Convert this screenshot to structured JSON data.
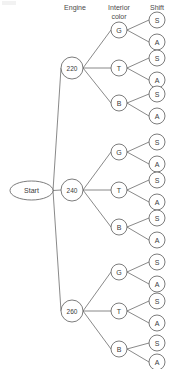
{
  "diagram": {
    "headers": [
      {
        "label": "Engine",
        "x": 75,
        "y": 7
      },
      {
        "label": "Interior",
        "x": 119,
        "y": 7
      },
      {
        "label": "color",
        "x": 119,
        "y": 16
      },
      {
        "label": "Shift",
        "x": 157,
        "y": 7
      }
    ],
    "root": {
      "label": "Start",
      "cx": 31.5,
      "cy": 190.5,
      "rx": 21.5,
      "ry": 9.5
    },
    "level1_label": "Engine",
    "level2_label": "Interior color",
    "level3_label": "Shift",
    "engines": [
      {
        "label": "220",
        "cx": 72,
        "cy": 68,
        "r": 11
      },
      {
        "label": "240",
        "cx": 72,
        "cy": 190,
        "r": 11
      },
      {
        "label": "260",
        "cx": 72,
        "cy": 311,
        "r": 11
      }
    ],
    "colors": [
      {
        "label": "G",
        "cx": 119,
        "cy": 30,
        "r": 8
      },
      {
        "label": "T",
        "cx": 119,
        "cy": 68,
        "r": 8
      },
      {
        "label": "B",
        "cx": 119,
        "cy": 103,
        "r": 8
      },
      {
        "label": "G",
        "cx": 119,
        "cy": 152,
        "r": 8
      },
      {
        "label": "T",
        "cx": 119,
        "cy": 190,
        "r": 8
      },
      {
        "label": "B",
        "cx": 119,
        "cy": 227,
        "r": 8
      },
      {
        "label": "G",
        "cx": 119,
        "cy": 272,
        "r": 8
      },
      {
        "label": "T",
        "cx": 119,
        "cy": 311,
        "r": 8
      },
      {
        "label": "B",
        "cx": 119,
        "cy": 349,
        "r": 8
      }
    ],
    "shifts": [
      {
        "label": "S",
        "cx": 157,
        "cy": 20,
        "r": 8
      },
      {
        "label": "A",
        "cx": 157,
        "cy": 42,
        "r": 8
      },
      {
        "label": "S",
        "cx": 157,
        "cy": 58,
        "r": 8
      },
      {
        "label": "A",
        "cx": 157,
        "cy": 80,
        "r": 8
      },
      {
        "label": "S",
        "cx": 157,
        "cy": 94,
        "r": 8
      },
      {
        "label": "A",
        "cx": 157,
        "cy": 116,
        "r": 8
      },
      {
        "label": "S",
        "cx": 157,
        "cy": 142,
        "r": 8
      },
      {
        "label": "A",
        "cx": 157,
        "cy": 164,
        "r": 8
      },
      {
        "label": "S",
        "cx": 157,
        "cy": 180,
        "r": 8
      },
      {
        "label": "A",
        "cx": 157,
        "cy": 202,
        "r": 8
      },
      {
        "label": "S",
        "cx": 157,
        "cy": 218,
        "r": 8
      },
      {
        "label": "A",
        "cx": 157,
        "cy": 240,
        "r": 8
      },
      {
        "label": "S",
        "cx": 157,
        "cy": 262,
        "r": 8
      },
      {
        "label": "A",
        "cx": 157,
        "cy": 284,
        "r": 8
      },
      {
        "label": "S",
        "cx": 157,
        "cy": 301,
        "r": 8
      },
      {
        "label": "A",
        "cx": 157,
        "cy": 323,
        "r": 8
      },
      {
        "label": "S",
        "cx": 157,
        "cy": 343,
        "r": 8
      },
      {
        "label": "A",
        "cx": 157,
        "cy": 362,
        "r": 8
      }
    ],
    "edges_root_to_engine": [
      {
        "x1": 53,
        "y1": 190.5,
        "x2": 61,
        "y2": 68
      },
      {
        "x1": 53,
        "y1": 190.5,
        "x2": 61,
        "y2": 190
      },
      {
        "x1": 53,
        "y1": 190.5,
        "x2": 61,
        "y2": 311
      }
    ],
    "edges_engine_to_color": [
      {
        "x1": 83,
        "y1": 68,
        "x2": 111,
        "y2": 30
      },
      {
        "x1": 83,
        "y1": 68,
        "x2": 111,
        "y2": 68
      },
      {
        "x1": 83,
        "y1": 68,
        "x2": 111,
        "y2": 103
      },
      {
        "x1": 83,
        "y1": 190,
        "x2": 111,
        "y2": 152
      },
      {
        "x1": 83,
        "y1": 190,
        "x2": 111,
        "y2": 190
      },
      {
        "x1": 83,
        "y1": 190,
        "x2": 111,
        "y2": 227
      },
      {
        "x1": 83,
        "y1": 311,
        "x2": 111,
        "y2": 272
      },
      {
        "x1": 83,
        "y1": 311,
        "x2": 111,
        "y2": 311
      },
      {
        "x1": 83,
        "y1": 311,
        "x2": 111,
        "y2": 349
      }
    ],
    "edges_color_to_shift": [
      {
        "x1": 127,
        "y1": 30,
        "x2": 149,
        "y2": 20
      },
      {
        "x1": 127,
        "y1": 30,
        "x2": 149,
        "y2": 42
      },
      {
        "x1": 127,
        "y1": 68,
        "x2": 149,
        "y2": 58
      },
      {
        "x1": 127,
        "y1": 68,
        "x2": 149,
        "y2": 80
      },
      {
        "x1": 127,
        "y1": 103,
        "x2": 149,
        "y2": 94
      },
      {
        "x1": 127,
        "y1": 103,
        "x2": 149,
        "y2": 116
      },
      {
        "x1": 127,
        "y1": 152,
        "x2": 149,
        "y2": 142
      },
      {
        "x1": 127,
        "y1": 152,
        "x2": 149,
        "y2": 164
      },
      {
        "x1": 127,
        "y1": 190,
        "x2": 149,
        "y2": 180
      },
      {
        "x1": 127,
        "y1": 190,
        "x2": 149,
        "y2": 202
      },
      {
        "x1": 127,
        "y1": 227,
        "x2": 149,
        "y2": 218
      },
      {
        "x1": 127,
        "y1": 227,
        "x2": 149,
        "y2": 240
      },
      {
        "x1": 127,
        "y1": 272,
        "x2": 149,
        "y2": 262
      },
      {
        "x1": 127,
        "y1": 272,
        "x2": 149,
        "y2": 284
      },
      {
        "x1": 127,
        "y1": 311,
        "x2": 149,
        "y2": 301
      },
      {
        "x1": 127,
        "y1": 311,
        "x2": 149,
        "y2": 323
      },
      {
        "x1": 127,
        "y1": 349,
        "x2": 149,
        "y2": 343
      },
      {
        "x1": 127,
        "y1": 349,
        "x2": 149,
        "y2": 362
      }
    ],
    "colors_hex": {
      "line": "#6b6b6b",
      "node_stroke": "#5a5a5a",
      "node_fill": "#ffffff",
      "text": "#3a3a3a",
      "header_text": "#4a4a4a",
      "background": "#ffffff"
    }
  }
}
